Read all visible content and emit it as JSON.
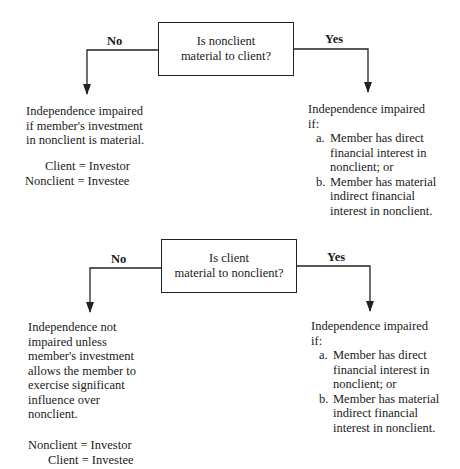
{
  "diagram": {
    "top": {
      "question_lines": [
        "Is nonclient",
        "material to client?"
      ],
      "no_label": "No",
      "yes_label": "Yes",
      "no_outcome_lines": [
        "Independence impaired",
        "if member's investment",
        "in nonclient is material."
      ],
      "no_equivalences": [
        "Client = Investor",
        "Nonclient = Investee"
      ],
      "yes_outcome": {
        "intro_lines": [
          "Independence impaired",
          "if:"
        ],
        "items": [
          {
            "marker": "a.",
            "lines": [
              "Member has direct",
              "financial interest in",
              "nonclient; or"
            ]
          },
          {
            "marker": "b.",
            "lines": [
              "Member has material",
              "indirect financial",
              "interest in nonclient."
            ]
          }
        ]
      }
    },
    "bottom": {
      "question_lines": [
        "Is client",
        "material to nonclient?"
      ],
      "no_label": "No",
      "yes_label": "Yes",
      "no_outcome_lines": [
        "Independence not",
        "impaired unless",
        "member's investment",
        "allows the member to",
        "exercise significant",
        "influence over",
        "nonclient."
      ],
      "no_equivalences": [
        "Nonclient = Investor",
        "Client = Investee"
      ],
      "yes_outcome": {
        "intro_lines": [
          "Independence impaired",
          "if:"
        ],
        "items": [
          {
            "marker": "a.",
            "lines": [
              "Member has direct",
              "financial interest in",
              "nonclient; or"
            ]
          },
          {
            "marker": "b.",
            "lines": [
              "Member has material",
              "indirect financial",
              "interest in nonclient."
            ]
          }
        ]
      }
    },
    "colors": {
      "line": "#222222",
      "text": "#1a1a1a",
      "background": "#ffffff"
    }
  }
}
